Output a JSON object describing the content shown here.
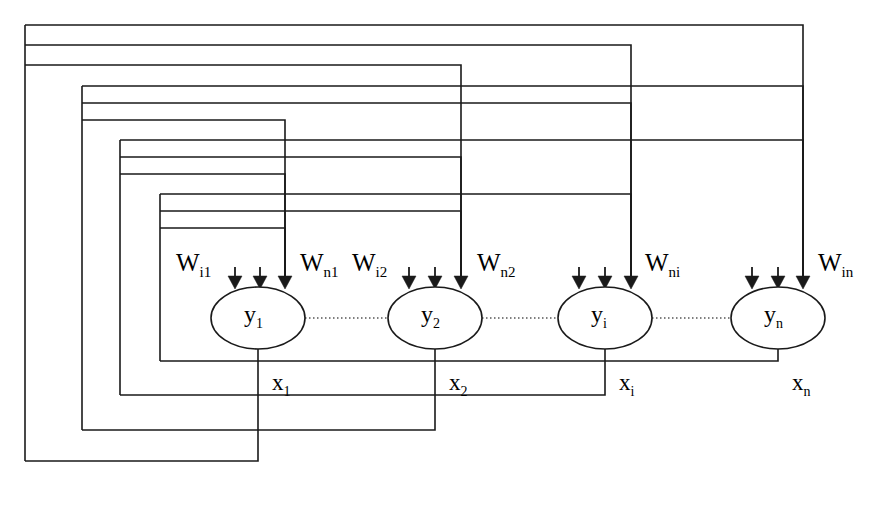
{
  "figure": {
    "kind": "recurrent-neural-network-diagram",
    "line_color": "#1a1a1a",
    "background_color": "#ffffff",
    "ellipse_fill": "#ffffff",
    "dotted_connector_color": "#555555"
  },
  "neurons": [
    {
      "id": "n1",
      "label": "y",
      "sub": "1",
      "cx": 258,
      "cy": 318,
      "rx": 47,
      "ry": 31,
      "output_label": "x",
      "output_sub": "1"
    },
    {
      "id": "n2",
      "label": "y",
      "sub": "2",
      "cx": 435,
      "cy": 318,
      "rx": 47,
      "ry": 31,
      "output_label": "x",
      "output_sub": "2"
    },
    {
      "id": "n3",
      "label": "y",
      "sub": "i",
      "cx": 605,
      "cy": 318,
      "rx": 47,
      "ry": 31,
      "output_label": "x",
      "output_sub": "i"
    },
    {
      "id": "n4",
      "label": "y",
      "sub": "n",
      "cx": 778,
      "cy": 318,
      "rx": 47,
      "ry": 31,
      "output_label": "x",
      "output_sub": "n"
    }
  ],
  "weight_labels": [
    {
      "id": "w_i1",
      "base": "W",
      "sub": "i1",
      "x": 176,
      "y": 249
    },
    {
      "id": "w_n1",
      "base": "W",
      "sub": "n1",
      "x": 300,
      "y": 249
    },
    {
      "id": "w_i2",
      "base": "W",
      "sub": "i2",
      "x": 352,
      "y": 249
    },
    {
      "id": "w_n2",
      "base": "W",
      "sub": "n2",
      "x": 477,
      "y": 249
    },
    {
      "id": "w_ni",
      "base": "W",
      "sub": "ni",
      "x": 645,
      "y": 249
    },
    {
      "id": "w_in",
      "base": "W",
      "sub": "in",
      "x": 818,
      "y": 249
    }
  ],
  "output_labels": [
    {
      "id": "x1",
      "base": "x",
      "sub": "1",
      "x": 272,
      "y": 370
    },
    {
      "id": "x2",
      "base": "x",
      "sub": "2",
      "x": 449,
      "y": 370
    },
    {
      "id": "xi",
      "base": "x",
      "sub": "i",
      "x": 619,
      "y": 370
    },
    {
      "id": "xn",
      "base": "x",
      "sub": "n",
      "x": 792,
      "y": 370
    }
  ],
  "arrows_into_neurons": [
    {
      "neuron": "n1",
      "xs": [
        235,
        260,
        285
      ],
      "tip_y": 289
    },
    {
      "neuron": "n2",
      "xs": [
        409,
        435,
        461
      ],
      "tip_y": 289
    },
    {
      "neuron": "n3",
      "xs": [
        579,
        605,
        631
      ],
      "tip_y": 289
    },
    {
      "neuron": "n4",
      "xs": [
        752,
        778,
        803
      ],
      "tip_y": 289
    }
  ],
  "dotted_connectors": [
    {
      "from": "n1",
      "to": "n2",
      "x1": 305,
      "x2": 388,
      "y": 318
    },
    {
      "from": "n2",
      "to": "n3",
      "x1": 482,
      "x2": 558,
      "y": 318
    },
    {
      "from": "n3",
      "to": "n4",
      "x1": 652,
      "x2": 731,
      "y": 318
    }
  ],
  "feedback_groups": [
    {
      "id": "group-1",
      "source_neuron": "n1",
      "left_x": 25,
      "bottom_y": 461,
      "out_drop_x": 258,
      "lines": [
        {
          "y": 25,
          "end_x": 803
        },
        {
          "y": 45,
          "end_x": 631
        },
        {
          "y": 65,
          "end_x": 461
        }
      ]
    },
    {
      "id": "group-2",
      "source_neuron": "n2",
      "left_x": 82,
      "bottom_y": 430,
      "out_drop_x": 435,
      "lines": [
        {
          "y": 86,
          "end_x": 803
        },
        {
          "y": 103,
          "end_x": 631
        },
        {
          "y": 120,
          "end_x": 285
        }
      ]
    },
    {
      "id": "group-3",
      "source_neuron": "n3",
      "left_x": 120,
      "bottom_y": 395,
      "out_drop_x": 605,
      "lines": [
        {
          "y": 140,
          "end_x": 803
        },
        {
          "y": 157,
          "end_x": 461
        },
        {
          "y": 174,
          "end_x": 285
        }
      ]
    },
    {
      "id": "group-4",
      "source_neuron": "n4",
      "left_x": 160,
      "bottom_y": 361,
      "out_drop_x": 258,
      "lines": [
        {
          "y": 194,
          "end_x": 631
        },
        {
          "y": 211,
          "end_x": 461
        },
        {
          "y": 228,
          "end_x": 285
        }
      ]
    }
  ]
}
